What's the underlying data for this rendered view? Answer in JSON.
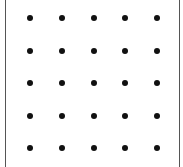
{
  "grid": {
    "rows": 5,
    "cols": 5,
    "x_centers": [
      30,
      62,
      94,
      125,
      157
    ],
    "y_centers": [
      18,
      51,
      83,
      116,
      148
    ],
    "dot_color": "#111111",
    "border_color": "#555555"
  }
}
